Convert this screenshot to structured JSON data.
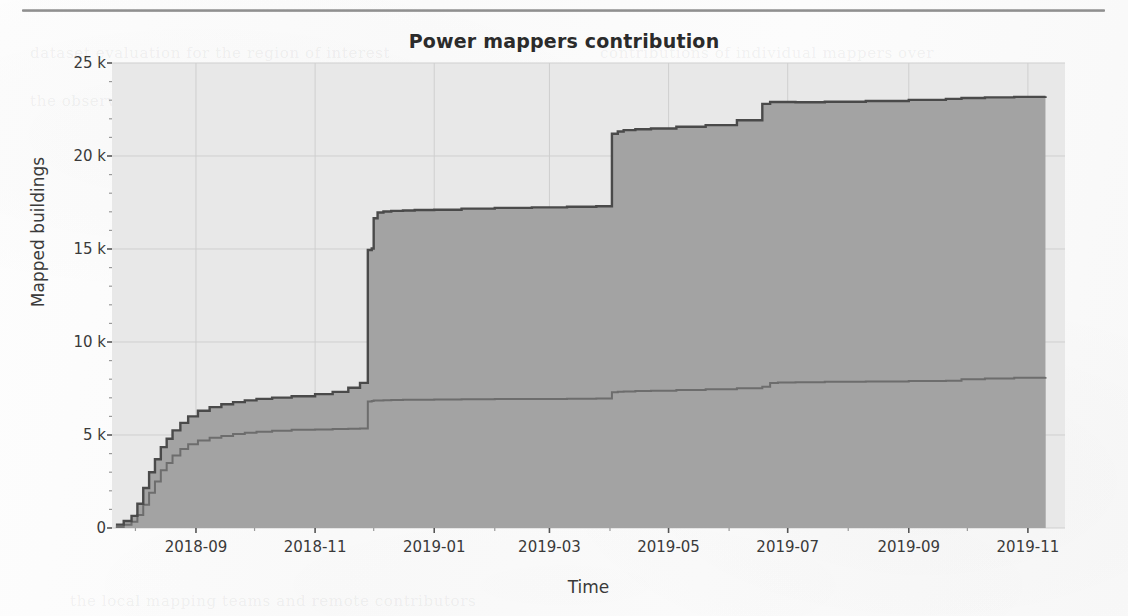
{
  "chart_data": {
    "type": "area",
    "stacked": true,
    "title": "Power mappers contribution",
    "xlabel": "Time",
    "ylabel": "Mapped buildings",
    "grid": true,
    "legend": "none",
    "xlim": [
      "2018-07-20",
      "2019-11-20"
    ],
    "ylim": [
      0,
      25000
    ],
    "yticks": [
      0,
      5000,
      10000,
      15000,
      20000,
      25000
    ],
    "ytick_labels": [
      "0",
      "5 k",
      "10 k",
      "15 k",
      "20 k",
      "25 k"
    ],
    "yminor_tick_step": 1000,
    "xticks": [
      "2018-09",
      "2018-11",
      "2019-01",
      "2019-03",
      "2019-05",
      "2019-07",
      "2019-09",
      "2019-11"
    ],
    "xtick_labels": [
      "2018-09",
      "2018-11",
      "2019-01",
      "2019-03",
      "2019-05",
      "2019-07",
      "2019-09",
      "2019-11"
    ],
    "colors": {
      "plot_background": "#e8e8e8",
      "lower_area_fill": "#a3a3a3",
      "upper_area_fill": "#a3a3a3",
      "line_total": "#4a4a4a",
      "line_lower": "#6d6d6d",
      "grid": "#cfcfcf",
      "text": "#3a3a3a",
      "page_background": "#fbfbfb",
      "rule": "#8d8d8d"
    },
    "x": [
      "2018-07-22",
      "2018-07-26",
      "2018-07-30",
      "2018-08-02",
      "2018-08-05",
      "2018-08-08",
      "2018-08-11",
      "2018-08-14",
      "2018-08-17",
      "2018-08-20",
      "2018-08-24",
      "2018-08-28",
      "2018-09-02",
      "2018-09-08",
      "2018-09-14",
      "2018-09-20",
      "2018-09-26",
      "2018-10-02",
      "2018-10-10",
      "2018-10-20",
      "2018-11-01",
      "2018-11-10",
      "2018-11-18",
      "2018-11-24",
      "2018-11-28",
      "2018-11-30",
      "2018-12-01",
      "2018-12-03",
      "2018-12-06",
      "2018-12-10",
      "2018-12-16",
      "2018-12-22",
      "2019-01-01",
      "2019-01-15",
      "2019-02-01",
      "2019-02-20",
      "2019-03-10",
      "2019-03-25",
      "2019-04-02",
      "2019-04-05",
      "2019-04-08",
      "2019-04-14",
      "2019-04-22",
      "2019-05-05",
      "2019-05-20",
      "2019-06-05",
      "2019-06-18",
      "2019-06-22",
      "2019-06-26",
      "2019-07-05",
      "2019-07-20",
      "2019-08-10",
      "2019-09-01",
      "2019-09-20",
      "2019-09-28",
      "2019-10-10",
      "2019-10-25",
      "2019-11-10"
    ],
    "series": [
      {
        "name": "Mapper A (lower band)",
        "values": [
          60,
          180,
          330,
          700,
          1250,
          1900,
          2500,
          3100,
          3500,
          3900,
          4250,
          4500,
          4700,
          4850,
          4950,
          5050,
          5120,
          5180,
          5230,
          5280,
          5300,
          5320,
          5340,
          5350,
          6800,
          6830,
          6850,
          6860,
          6870,
          6880,
          6890,
          6900,
          6910,
          6920,
          6930,
          6940,
          6950,
          6960,
          7300,
          7320,
          7340,
          7360,
          7380,
          7420,
          7460,
          7520,
          7600,
          7800,
          7820,
          7840,
          7860,
          7880,
          7900,
          7920,
          8000,
          8040,
          8080,
          8120
        ]
      },
      {
        "name": "Mapper B (upper band)",
        "values": [
          120,
          200,
          320,
          600,
          900,
          1100,
          1200,
          1250,
          1300,
          1350,
          1400,
          1500,
          1600,
          1650,
          1700,
          1720,
          1740,
          1760,
          1780,
          1800,
          1900,
          2000,
          2200,
          2450,
          8150,
          8200,
          9800,
          10100,
          10150,
          10170,
          10180,
          10190,
          10200,
          10250,
          10280,
          10300,
          10320,
          10340,
          13900,
          14000,
          14050,
          14080,
          14100,
          14150,
          14200,
          14400,
          15200,
          15100,
          15080,
          15050,
          15060,
          15080,
          15120,
          15150,
          15120,
          15110,
          15100,
          15090
        ]
      }
    ],
    "total_values": [
      180,
      380,
      650,
      1300,
      2150,
      3000,
      3700,
      4350,
      4800,
      5250,
      5650,
      6000,
      6300,
      6500,
      6650,
      6770,
      6860,
      6940,
      7010,
      7080,
      7200,
      7320,
      7540,
      7800,
      14950,
      15030,
      16650,
      16960,
      17020,
      17050,
      17070,
      17100,
      17110,
      17170,
      17210,
      17240,
      17270,
      17300,
      21200,
      21320,
      21390,
      21440,
      21480,
      21570,
      21660,
      21920,
      22800,
      22900,
      22900,
      22890,
      22920,
      22960,
      23020,
      23070,
      23120,
      23150,
      23180,
      23210
    ],
    "annotations": []
  },
  "page": {
    "rule_present": true,
    "ghost_lines": [
      {
        "text": "dataset evaluation for the region of interest",
        "x": 30,
        "y": 44,
        "size": 15
      },
      {
        "text": "contributions of individual mappers over",
        "x": 600,
        "y": 44,
        "size": 15
      },
      {
        "text": "the observed time window, cumulative",
        "x": 30,
        "y": 92,
        "size": 15
      },
      {
        "text": "counts of mapped building footprints",
        "x": 620,
        "y": 92,
        "size": 15
      },
      {
        "text": "Cluster analysis of mappers",
        "x": 330,
        "y": 200,
        "size": 16
      },
      {
        "text": "power users",
        "x": 250,
        "y": 318,
        "size": 16
      },
      {
        "text": "Building mapping",
        "x": 300,
        "y": 452,
        "size": 16
      },
      {
        "text": "the local mapping teams and remote contributors",
        "x": 70,
        "y": 592,
        "size": 15
      }
    ]
  }
}
